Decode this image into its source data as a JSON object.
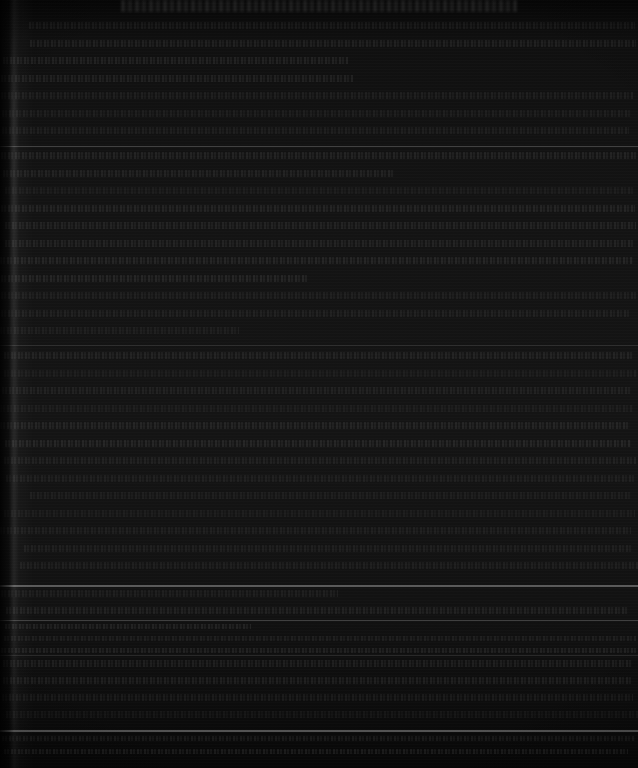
{
  "page": {
    "kind": "scanned-document-page",
    "width": 638,
    "height": 768,
    "legibility": "illegible",
    "legibility_note": "Severely underexposed scan; no glyph is resolvable at any magnification.",
    "background_color": "#0b0b0b",
    "paper_tone_range": [
      "#060606",
      "#141414"
    ],
    "ink_tone": "#1c1c1c",
    "rule_color": "#333333"
  },
  "artifacts": {
    "gutter_shadow": {
      "name": "left-page-gutter-shadow",
      "edge": "left",
      "width_px": 34,
      "description": "Vertical curl/binding shadow with a faint specular highlight streak."
    },
    "scan_banding": {
      "name": "horizontal-sensor-banding",
      "description": "Repeating 1px horizontal streaks across the full page."
    },
    "top_crop": {
      "name": "cropped-heading",
      "description": "A row of large glyphs clipped by the top edge of the crop."
    }
  },
  "structure": {
    "columns": 1,
    "text_block": {
      "left_px": 0,
      "right_px": 638,
      "full_bleed": true
    },
    "body_line_spacing_px": 17.5,
    "dense_line_spacing_px": 12,
    "blocks": [
      {
        "name": "cropped-heading",
        "top": 0,
        "bottom": 14,
        "line_spacing": 0,
        "style": "heading"
      },
      {
        "name": "body-block-1",
        "top": 22,
        "bottom": 142,
        "line_spacing": 17.5,
        "style": "body"
      },
      {
        "name": "body-block-2",
        "top": 152,
        "bottom": 341,
        "line_spacing": 17.5,
        "style": "body"
      },
      {
        "name": "body-block-3",
        "top": 352,
        "bottom": 580,
        "line_spacing": 17.5,
        "style": "body"
      },
      {
        "name": "body-block-4",
        "top": 590,
        "bottom": 616,
        "line_spacing": 17,
        "style": "body"
      },
      {
        "name": "footnote-block",
        "top": 624,
        "bottom": 652,
        "line_spacing": 12,
        "style": "dense"
      },
      {
        "name": "body-block-5",
        "top": 660,
        "bottom": 726,
        "line_spacing": 17,
        "style": "body"
      },
      {
        "name": "footer-block",
        "top": 736,
        "bottom": 764,
        "line_spacing": 13,
        "style": "dense"
      }
    ],
    "rules": [
      {
        "name": "section-rule-1",
        "y": 146,
        "weight": "normal"
      },
      {
        "name": "section-rule-2",
        "y": 345,
        "weight": "soft"
      },
      {
        "name": "section-rule-3",
        "y": 585,
        "weight": "strong"
      },
      {
        "name": "section-rule-4",
        "y": 620,
        "weight": "normal"
      },
      {
        "name": "section-rule-5",
        "y": 655,
        "weight": "soft"
      },
      {
        "name": "footer-rule",
        "y": 730,
        "weight": "strong"
      }
    ]
  },
  "text": {
    "heading": "",
    "body": "",
    "footnote": "",
    "footer": "",
    "unreadable_placeholder": "[illegible — underexposed scan]"
  }
}
